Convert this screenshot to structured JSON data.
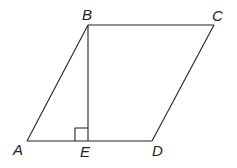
{
  "diagram": {
    "type": "parallelogram-with-altitude",
    "stroke_color": "#222222",
    "background": "#ffffff",
    "points": {
      "A": {
        "label": "A",
        "x": 27,
        "y": 141
      },
      "B": {
        "label": "B",
        "x": 88,
        "y": 25
      },
      "C": {
        "label": "C",
        "x": 214,
        "y": 25
      },
      "D": {
        "label": "D",
        "x": 152,
        "y": 141
      },
      "E": {
        "label": "E",
        "x": 88,
        "y": 141
      }
    },
    "segments": [
      "AB",
      "BC",
      "CD",
      "DA",
      "BE"
    ],
    "right_angle_marker": {
      "at": "E",
      "size": 13
    }
  }
}
